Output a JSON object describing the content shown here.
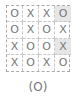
{
  "grid": {
    "rows": [
      [
        "O",
        "X",
        "X",
        "O"
      ],
      [
        "O",
        "X",
        "O",
        "X"
      ],
      [
        "X",
        "O",
        "O",
        "X"
      ],
      [
        "X",
        "O",
        "X",
        "O"
      ]
    ],
    "highlighted": [
      [
        0,
        3
      ],
      [
        2,
        3
      ]
    ],
    "highlight_color": "#e6e6e6"
  },
  "caption": "(O)"
}
